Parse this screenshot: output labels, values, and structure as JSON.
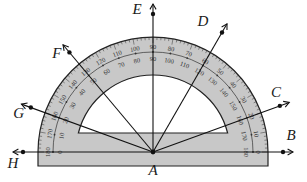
{
  "diagram": {
    "type": "protractor-angle-diagram",
    "vertex": {
      "label": "A"
    },
    "rays": [
      {
        "label": "B",
        "angle_deg": 0
      },
      {
        "label": "C",
        "angle_deg": 20
      },
      {
        "label": "D",
        "angle_deg": 60
      },
      {
        "label": "E",
        "angle_deg": 90
      },
      {
        "label": "F",
        "angle_deg": 130
      },
      {
        "label": "G",
        "angle_deg": 160
      },
      {
        "label": "H",
        "angle_deg": 180
      }
    ],
    "outer_scale": [
      "180",
      "170",
      "160",
      "150",
      "140",
      "130",
      "120",
      "110",
      "100",
      "90",
      "80",
      "70",
      "60",
      "50",
      "40",
      "30",
      "20",
      "10",
      "0"
    ],
    "inner_scale": [
      "0",
      "10",
      "20",
      "30",
      "40",
      "50",
      "60",
      "70",
      "80",
      "90",
      "100",
      "110",
      "120",
      "130",
      "140",
      "150",
      "160",
      "170",
      "180"
    ],
    "colors": {
      "protractor_fill": "#c8c8c8",
      "outline": "#222222",
      "ray": "#111111",
      "background": "#ffffff"
    }
  }
}
